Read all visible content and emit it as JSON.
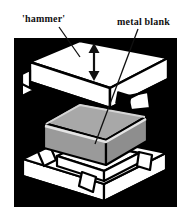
{
  "figure": {
    "background_color": "#ffffff",
    "panel_color": "#000000",
    "labels": [
      {
        "id": "hammer",
        "text": "'hammer'",
        "x": 22,
        "y": 22
      },
      {
        "id": "metal-blank",
        "text": "metal blank",
        "x": 117,
        "y": 25
      }
    ],
    "leaders": [
      {
        "id": "hammer-leader",
        "x1": 59,
        "y1": 27,
        "x2": 80,
        "y2": 57
      },
      {
        "id": "metal-blank-leader",
        "x1": 138,
        "y1": 29,
        "x2": 95,
        "y2": 144
      }
    ],
    "motion_arrow": {
      "id": "vertical-double-arrow",
      "label": "hammer stroke direction",
      "x": 94,
      "y_top": 45,
      "y_bottom": 79,
      "color": "#111111"
    },
    "parts": [
      {
        "id": "upper-die",
        "name": "hammer (upper die)",
        "fill": "#ffffff",
        "stroke": "#000000"
      },
      {
        "id": "metal-blank",
        "name": "metal blank",
        "fill": "#a0a0a0",
        "stroke": "#000000"
      },
      {
        "id": "lower-die",
        "name": "lower die block",
        "fill": "#ffffff",
        "stroke": "#000000"
      }
    ],
    "panel": {
      "x": 14,
      "y": 38,
      "width": 163,
      "height": 169
    },
    "colors": {
      "ink": "#000000",
      "paper": "#ffffff",
      "blank_gray": "#a0a0a0",
      "blank_gray_shadow": "#8a8a8a",
      "blank_gray_light": "#b8b8b8",
      "die_shade": "#d8d8d8"
    }
  }
}
